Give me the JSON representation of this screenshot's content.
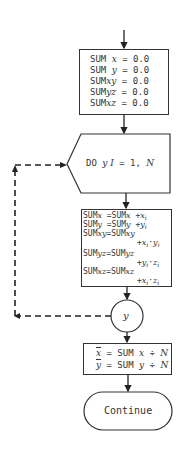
{
  "flowchart": {
    "init_box": {
      "lines": [
        {
          "prefix": "SUM ",
          "var": "x",
          "suffix": " = 0.0"
        },
        {
          "prefix": "SUM ",
          "var": "y",
          "suffix": " = 0.0"
        },
        {
          "prefix": "SUM",
          "var": "xy",
          "suffix": " = 0.0"
        },
        {
          "prefix": "SUM",
          "var": "yz",
          "suffix": " = 0.0"
        },
        {
          "prefix": "SUM",
          "var": "xz",
          "suffix": " = 0.0"
        }
      ]
    },
    "loop_box": {
      "keyword": "DO ",
      "label": "y",
      "index": " I",
      "range": " = 1, ",
      "limit": "N"
    },
    "calc_box": {
      "l1a": "SUM",
      "l1b": "x",
      "l1c": " =SUM",
      "l1d": "x",
      "l1e": " +",
      "l1f": "x",
      "l1g": "i",
      "l2a": "SUM",
      "l2b": "y",
      "l2c": " =SUM",
      "l2d": "y",
      "l2e": " +",
      "l2f": "y",
      "l2g": "i",
      "l3a": "SUM",
      "l3b": "xy",
      "l3c": "=SUM",
      "l3d": "xy",
      "l4a": "+",
      "l4b": "x",
      "l4c": "i",
      "l4d": "·",
      "l4e": "y",
      "l4f": "i",
      "l5a": "SUM",
      "l5b": "yz",
      "l5c": "=SUM",
      "l5d": "yz",
      "l6a": "+",
      "l6b": "y",
      "l6c": "i",
      "l6d": "·",
      "l6e": "z",
      "l6f": "i",
      "l7a": "SUM",
      "l7b": "xz",
      "l7c": "=SUM",
      "l7d": "xz",
      "l8a": "+",
      "l8b": "x",
      "l8c": "i",
      "l8d": "·",
      "l8e": "z",
      "l8f": "i"
    },
    "connector": {
      "label": "y"
    },
    "mean_box": {
      "l1a": "x",
      "l1b": " = SUM ",
      "l1c": "x",
      "l1d": " ÷ ",
      "l1e": "N",
      "l2a": "y",
      "l2b": " = SUM ",
      "l2c": "y",
      "l2d": " ÷ ",
      "l2e": "N"
    },
    "terminal": {
      "label": "Continue"
    }
  }
}
